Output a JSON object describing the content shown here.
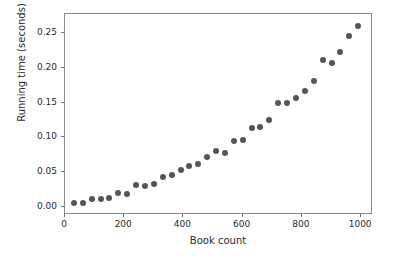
{
  "chart_data": {
    "type": "scatter",
    "title": "",
    "xlabel": "Book count",
    "ylabel": "Running time (seconds)",
    "xlim": [
      0,
      1040
    ],
    "ylim": [
      -0.012,
      0.278
    ],
    "xticks": [
      0,
      200,
      400,
      600,
      800,
      1000
    ],
    "xticklabels": [
      "0",
      "200",
      "400",
      "600",
      "800",
      "1000"
    ],
    "yticks": [
      0.0,
      0.05,
      0.1,
      0.15,
      0.2,
      0.25
    ],
    "yticklabels": [
      "0.00",
      "0.05",
      "0.10",
      "0.15",
      "0.20",
      "0.25"
    ],
    "grid": false,
    "legend": null,
    "marker_color": "#555555",
    "marker_size": 6,
    "series": [
      {
        "name": "running time",
        "x": [
          30,
          60,
          90,
          120,
          150,
          180,
          210,
          240,
          270,
          300,
          330,
          360,
          390,
          420,
          450,
          480,
          510,
          540,
          570,
          600,
          630,
          660,
          690,
          720,
          750,
          780,
          810,
          840,
          870,
          900,
          930,
          960,
          990
        ],
        "y": [
          0.005,
          0.006,
          0.011,
          0.011,
          0.012,
          0.02,
          0.018,
          0.031,
          0.03,
          0.033,
          0.043,
          0.046,
          0.053,
          0.059,
          0.061,
          0.072,
          0.08,
          0.077,
          0.095,
          0.096,
          0.113,
          0.115,
          0.125,
          0.15,
          0.149,
          0.157,
          0.167,
          0.181,
          0.212,
          0.208,
          0.223,
          0.246,
          0.261
        ]
      }
    ]
  }
}
